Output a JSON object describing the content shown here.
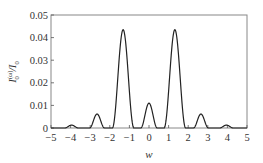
{
  "chart_data": {
    "type": "line",
    "title": "",
    "xlabel": "w",
    "ylabel": "I_0^(ω)/I_0",
    "xlim": [
      -5,
      5
    ],
    "ylim": [
      0,
      0.05
    ],
    "grid": false,
    "legend": null,
    "xticks": [
      -5,
      -4,
      -3,
      -2,
      -1,
      0,
      1,
      2,
      3,
      4,
      5
    ],
    "yticks": [
      0,
      0.01,
      0.02,
      0.03,
      0.04,
      0.05
    ],
    "ytick_labels": [
      "0",
      "0.01",
      "0.02",
      "0.03",
      "0.04",
      "0.05"
    ],
    "xtick_labels": [
      "−5",
      "−4",
      "−3",
      "−2",
      "−1",
      "0",
      "1",
      "2",
      "3",
      "4",
      "5"
    ],
    "peaks": [
      {
        "x": -3.95,
        "y": 0.0013,
        "halfwidth": 0.35
      },
      {
        "x": -2.65,
        "y": 0.0062,
        "halfwidth": 0.38
      },
      {
        "x": -1.32,
        "y": 0.0435,
        "halfwidth": 0.55
      },
      {
        "x": 0.0,
        "y": 0.011,
        "halfwidth": 0.42
      },
      {
        "x": 1.32,
        "y": 0.0435,
        "halfwidth": 0.55
      },
      {
        "x": 2.65,
        "y": 0.0062,
        "halfwidth": 0.38
      },
      {
        "x": 3.95,
        "y": 0.0013,
        "halfwidth": 0.35
      }
    ],
    "series": [
      {
        "name": "I_0^(ω)/I_0",
        "x": [
          -5.0,
          -4.5,
          -4.3,
          -4.1,
          -3.95,
          -3.8,
          -3.6,
          -3.4,
          -3.0,
          -2.9,
          -2.8,
          -2.65,
          -2.5,
          -2.4,
          -2.3,
          -2.0,
          -1.85,
          -1.7,
          -1.5,
          -1.32,
          -1.15,
          -0.95,
          -0.8,
          -0.6,
          -0.4,
          -0.3,
          -0.2,
          -0.1,
          0.0,
          0.1,
          0.2,
          0.3,
          0.4,
          0.6,
          0.8,
          0.95,
          1.15,
          1.32,
          1.5,
          1.7,
          1.85,
          2.0,
          2.3,
          2.4,
          2.5,
          2.65,
          2.8,
          2.9,
          3.0,
          3.4,
          3.6,
          3.8,
          3.95,
          4.1,
          4.3,
          4.5,
          5.0
        ],
        "y": [
          0.0,
          0.0,
          0.0002,
          0.001,
          0.0013,
          0.001,
          0.0002,
          0.0,
          0.0,
          0.0015,
          0.0045,
          0.0062,
          0.0045,
          0.0015,
          0.0,
          0.0,
          0.004,
          0.018,
          0.037,
          0.0435,
          0.037,
          0.018,
          0.004,
          0.0,
          0.0,
          0.0025,
          0.0075,
          0.0105,
          0.011,
          0.0105,
          0.0075,
          0.0025,
          0.0,
          0.0,
          0.004,
          0.018,
          0.037,
          0.0435,
          0.037,
          0.018,
          0.004,
          0.0,
          0.0,
          0.0015,
          0.0045,
          0.0062,
          0.0045,
          0.0015,
          0.0,
          0.0,
          0.0002,
          0.001,
          0.0013,
          0.001,
          0.0002,
          0.0,
          0.0
        ]
      }
    ]
  },
  "style": {
    "line_color": "#222222",
    "axis_color": "#555555",
    "frame_color": "#888888",
    "background": "#ffffff"
  }
}
